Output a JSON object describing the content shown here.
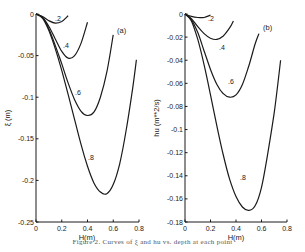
{
  "chart_data": [
    {
      "type": "line",
      "panel": "(a)",
      "title": "",
      "xlabel": "H(m)",
      "ylabel": "ξ (m)",
      "xlim": [
        0,
        0.8
      ],
      "ylim": [
        -0.25,
        0
      ],
      "xticks": [
        "0",
        "0.2",
        "0.4",
        "0.6",
        "0.8"
      ],
      "yticks": [
        "0",
        "-0.05",
        "-0.1",
        "-0.15",
        "-0.2",
        "-0.25"
      ],
      "grid": false,
      "series": [
        {
          "name": ".2",
          "x": [
            0,
            0.05,
            0.1,
            0.15,
            0.2,
            0.25
          ],
          "y": [
            0,
            -0.003,
            -0.008,
            -0.011,
            -0.009,
            -0.002
          ]
        },
        {
          "name": ".4",
          "x": [
            0,
            0.05,
            0.1,
            0.15,
            0.2,
            0.25,
            0.3,
            0.35,
            0.4
          ],
          "y": [
            0,
            -0.004,
            -0.015,
            -0.03,
            -0.045,
            -0.053,
            -0.05,
            -0.035,
            -0.01
          ]
        },
        {
          "name": ".6",
          "x": [
            0,
            0.05,
            0.1,
            0.15,
            0.2,
            0.25,
            0.3,
            0.35,
            0.4,
            0.45,
            0.5,
            0.55,
            0.6
          ],
          "y": [
            0,
            -0.004,
            -0.018,
            -0.038,
            -0.06,
            -0.083,
            -0.103,
            -0.117,
            -0.122,
            -0.118,
            -0.1,
            -0.07,
            -0.025
          ]
        },
        {
          "name": ".8",
          "x": [
            0,
            0.05,
            0.1,
            0.15,
            0.2,
            0.25,
            0.3,
            0.35,
            0.4,
            0.45,
            0.5,
            0.55,
            0.6,
            0.65,
            0.7,
            0.75,
            0.78
          ],
          "y": [
            0,
            -0.005,
            -0.02,
            -0.042,
            -0.068,
            -0.097,
            -0.127,
            -0.157,
            -0.183,
            -0.203,
            -0.214,
            -0.216,
            -0.205,
            -0.18,
            -0.14,
            -0.09,
            -0.055
          ]
        }
      ],
      "annotations": [
        ".2",
        ".4",
        ".6",
        ".8",
        "(a)"
      ]
    },
    {
      "type": "line",
      "panel": "(b)",
      "title": "",
      "xlabel": "H(m)",
      "ylabel": "hu (m**2/s)",
      "xlim": [
        0,
        0.8
      ],
      "ylim": [
        -0.18,
        0
      ],
      "xticks": [
        "0",
        "0.2",
        "0.4",
        "0.6",
        "0.8"
      ],
      "yticks": [
        "0",
        "-0.02",
        "-0.04",
        "-0.06",
        "-0.08",
        "-0.1",
        "-0.12",
        "-0.14",
        "-0.16",
        "-0.18"
      ],
      "grid": false,
      "series": [
        {
          "name": ".2",
          "x": [
            0,
            0.05,
            0.1,
            0.15,
            0.2
          ],
          "y": [
            0,
            -0.002,
            -0.003,
            -0.003,
            -0.001
          ]
        },
        {
          "name": ".4",
          "x": [
            0,
            0.05,
            0.1,
            0.15,
            0.2,
            0.25,
            0.3,
            0.35,
            0.38
          ],
          "y": [
            0,
            -0.004,
            -0.011,
            -0.017,
            -0.021,
            -0.022,
            -0.019,
            -0.012,
            -0.006
          ]
        },
        {
          "name": ".6",
          "x": [
            0,
            0.05,
            0.1,
            0.15,
            0.2,
            0.25,
            0.3,
            0.35,
            0.4,
            0.45,
            0.5,
            0.55,
            0.58
          ],
          "y": [
            0,
            -0.005,
            -0.016,
            -0.032,
            -0.048,
            -0.061,
            -0.069,
            -0.072,
            -0.07,
            -0.061,
            -0.045,
            -0.026,
            -0.017
          ]
        },
        {
          "name": ".8",
          "x": [
            0,
            0.05,
            0.1,
            0.15,
            0.2,
            0.25,
            0.3,
            0.35,
            0.4,
            0.45,
            0.5,
            0.55,
            0.6,
            0.65,
            0.7,
            0.75
          ],
          "y": [
            0,
            -0.006,
            -0.022,
            -0.044,
            -0.07,
            -0.097,
            -0.122,
            -0.143,
            -0.158,
            -0.167,
            -0.17,
            -0.166,
            -0.15,
            -0.12,
            -0.085,
            -0.04
          ]
        }
      ],
      "annotations": [
        ".2",
        ".4",
        ".6",
        ".8",
        "(b)"
      ]
    }
  ],
  "panels": {
    "a": {
      "label": "(a)",
      "xlabel": "H(m)",
      "ylabel": "ξ (m)",
      "xticks": [
        "0",
        "0.2",
        "0.4",
        "0.6",
        "0.8"
      ],
      "yticks": [
        "0",
        "-0.05",
        "-0.1",
        "-0.15",
        "-0.2",
        "-0.25"
      ],
      "curve_labels": [
        ".2",
        ".4",
        ".6",
        ".8"
      ]
    },
    "b": {
      "label": "(b)",
      "xlabel": "H(m)",
      "ylabel": "hu (m**2/s)",
      "xticks": [
        "0",
        "0.2",
        "0.4",
        "0.6",
        "0.8"
      ],
      "yticks": [
        "0",
        "-0.02",
        "-0.04",
        "-0.06",
        "-0.08",
        "-0.1",
        "-0.12",
        "-0.14",
        "-0.16",
        "-0.18"
      ],
      "curve_labels": [
        ".2",
        ".4",
        ".6",
        ".8"
      ]
    }
  },
  "caption": "Figure 2. Curves of ξ and hu vs. depth at each point"
}
